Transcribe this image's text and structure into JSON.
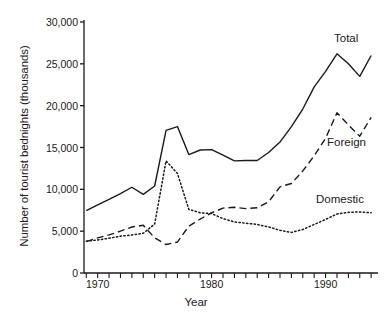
{
  "chart_data": {
    "type": "line",
    "title": "",
    "xlabel": "Year",
    "ylabel": "Number of tourist bednights (thousands)",
    "xlim": [
      1968.8,
      1994.6
    ],
    "ylim": [
      0,
      30000
    ],
    "grid": false,
    "legend_position": "inline-right-of-series",
    "yticks": [
      0,
      5000,
      10000,
      15000,
      20000,
      25000,
      30000
    ],
    "ytick_labels": [
      "0",
      "5,000",
      "10,000",
      "15,000",
      "20,000",
      "25,000",
      "30,000"
    ],
    "xticks": [
      1969,
      1970,
      1971,
      1972,
      1973,
      1974,
      1975,
      1976,
      1977,
      1978,
      1979,
      1980,
      1981,
      1982,
      1983,
      1984,
      1985,
      1986,
      1987,
      1988,
      1989,
      1990,
      1991,
      1992,
      1993,
      1994
    ],
    "xtick_labels_shown": [
      "1970",
      "1980",
      "1990"
    ],
    "xtick_labels_values": [
      1970,
      1980,
      1990
    ],
    "x": [
      1969,
      1970,
      1971,
      1972,
      1973,
      1974,
      1975,
      1976,
      1977,
      1978,
      1979,
      1980,
      1981,
      1982,
      1983,
      1984,
      1985,
      1986,
      1987,
      1988,
      1989,
      1990,
      1991,
      1992,
      1993,
      1994
    ],
    "series": [
      {
        "name": "Total",
        "style": "solid",
        "values": [
          7450,
          8150,
          8800,
          9500,
          10250,
          9400,
          10400,
          17050,
          17500,
          14150,
          14700,
          14750,
          14100,
          13400,
          13450,
          13450,
          14400,
          15650,
          17500,
          19600,
          22250,
          24100,
          26200,
          25000,
          23500,
          26000
        ]
      },
      {
        "name": "Foreign",
        "style": "dashed",
        "values": [
          3750,
          4200,
          4550,
          5000,
          5500,
          5700,
          4200,
          3400,
          3700,
          5600,
          6450,
          7200,
          7750,
          7850,
          7700,
          7800,
          8500,
          10300,
          10700,
          12200,
          14000,
          16100,
          19150,
          17700,
          16350,
          18600
        ]
      },
      {
        "name": "Domestic",
        "style": "dotted",
        "values": [
          3800,
          3950,
          4150,
          4400,
          4550,
          4750,
          5850,
          13400,
          11900,
          7600,
          7200,
          7100,
          6500,
          6100,
          5950,
          5800,
          5500,
          5100,
          4850,
          5200,
          5800,
          6400,
          7050,
          7250,
          7300,
          7200
        ]
      }
    ]
  },
  "series_labels": {
    "total": "Total",
    "foreign": "Foreign",
    "domestic": "Domestic"
  },
  "axis": {
    "x_title": "Year",
    "y_title": "Number of tourist bednights (thousands)"
  },
  "colors": {
    "line": "#1a1a1a",
    "axis": "#1a1a1a",
    "background": "#ffffff"
  }
}
